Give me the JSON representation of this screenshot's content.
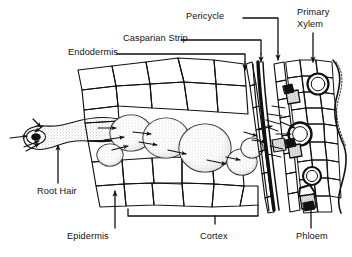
{
  "figure": {
    "type": "botanical-line-drawing",
    "ink_color": "#111111",
    "stipple_color": "#8c8c8c",
    "background": "#ffffff"
  },
  "labels": {
    "pericycle": "Pericycle",
    "casparian_strip": "Casparian Strip",
    "endodermis": "Endodermis",
    "primary": "Primary",
    "xylem": "Xylem",
    "root_hair": "Root Hair",
    "epidermis": "Epidermis",
    "cortex": "Cortex",
    "phloem": "Phloem"
  },
  "annotations": [
    {
      "name": "pericycle",
      "leader": "elbow-right-down",
      "points_to": "pericycle cell layer"
    },
    {
      "name": "casparian-strip",
      "leader": "elbow-right-down",
      "points_to": "endodermal casparian band"
    },
    {
      "name": "endodermis",
      "leader": "elbow-right-down",
      "points_to": "endodermis cell layer"
    },
    {
      "name": "primary-xylem",
      "leader": "straight-down",
      "points_to": "xylem vessel element"
    },
    {
      "name": "root-hair",
      "leader": "arrow-up",
      "points_to": "root hair tube"
    },
    {
      "name": "epidermis",
      "leader": "arrow-up",
      "points_to": "epidermal cell"
    },
    {
      "name": "cortex",
      "leader": "span-bracket",
      "points_to": "cortex cell region"
    },
    {
      "name": "phloem",
      "leader": "arrow-up",
      "points_to": "phloem cell cluster"
    }
  ]
}
